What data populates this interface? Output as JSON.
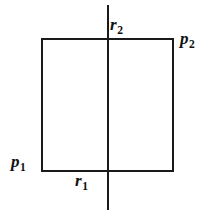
{
  "figure": {
    "background_color": "#ffffff",
    "ink_color": "#1a1a1a",
    "shapes": {
      "rectangle": {
        "name": "rectangle",
        "left": 42,
        "top": 39,
        "right": 173,
        "bottom": 171,
        "width": 131,
        "height": 132,
        "stroke_width": 2
      },
      "vertical_line": {
        "name": "vertical-line",
        "x": 108,
        "y_start": 5,
        "y_end": 210,
        "stroke_width": 2.6
      }
    },
    "labels": [
      {
        "id": "r2",
        "base": "r",
        "subscript": "2",
        "position": "above-top-edge-right-of-vertical-line",
        "x": 110,
        "y": 16
      },
      {
        "id": "p2",
        "base": "p",
        "subscript": "2",
        "position": "outside-top-right-corner",
        "x": 180,
        "y": 30
      },
      {
        "id": "p1",
        "base": "p",
        "subscript": "1",
        "position": "outside-bottom-left-corner",
        "x": 11,
        "y": 153
      },
      {
        "id": "r1",
        "base": "r",
        "subscript": "1",
        "position": "below-bottom-edge-left-of-vertical-line",
        "x": 75,
        "y": 172
      }
    ]
  }
}
